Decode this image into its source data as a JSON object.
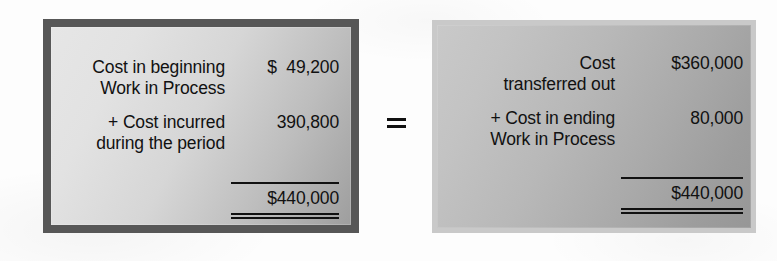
{
  "diagram": {
    "operator": "=",
    "colors": {
      "background": "#fdfdfd",
      "text": "#111111",
      "left_border": "#575757",
      "right_border": "#c9c9c9",
      "rule": "#111111"
    },
    "left_panel": {
      "name": "costs-to-account-for",
      "rows": [
        {
          "label": "Cost in beginning\nWork in Process",
          "amount": "$  49,200"
        },
        {
          "label": "+ Cost incurred\nduring the period",
          "amount": "390,800"
        }
      ],
      "total": "$440,000"
    },
    "right_panel": {
      "name": "costs-accounted-for",
      "rows": [
        {
          "label": "Cost\ntransferred out",
          "amount": "$360,000"
        },
        {
          "label": "+ Cost in ending\nWork in Process",
          "amount": "80,000"
        }
      ],
      "total": "$440,000"
    }
  }
}
